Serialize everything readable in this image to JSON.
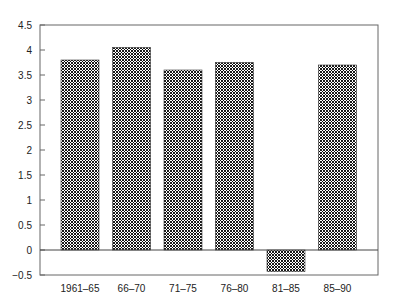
{
  "chart_data": {
    "type": "bar",
    "title": "",
    "xlabel": "",
    "ylabel": "",
    "categories": [
      "1961–65",
      "66–70",
      "71–75",
      "76–80",
      "81–85",
      "85–90"
    ],
    "values": [
      3.8,
      4.05,
      3.6,
      3.75,
      -0.43,
      3.7
    ],
    "ylim": [
      -0.5,
      4.5
    ],
    "yticks": [
      -0.5,
      0,
      0.5,
      1,
      1.5,
      2,
      2.5,
      3,
      3.5,
      4,
      4.5
    ],
    "ytick_labels": [
      "−0.5",
      "0",
      "0.5",
      "1",
      "1.5",
      "2",
      "2.5",
      "3",
      "3.5",
      "4",
      "4.5"
    ],
    "grid": false,
    "legend": null,
    "bar_fill": "crosshatch",
    "colors": {
      "bar_line": "#000000",
      "bar_bg": "#ffffff",
      "axis": "#555555",
      "zero_line": "#444444"
    }
  }
}
